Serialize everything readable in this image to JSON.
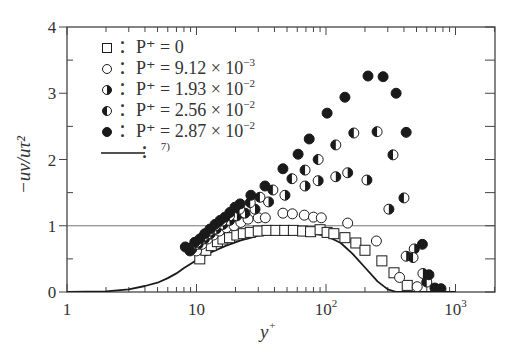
{
  "chart_data": {
    "type": "scatter",
    "title": "",
    "xlabel": "y+",
    "ylabel": "-uv/u_tau^2",
    "xscale": "log",
    "xlim": [
      1,
      2000
    ],
    "ylim": [
      0,
      4
    ],
    "xticks": [
      1,
      10,
      100,
      1000
    ],
    "xtick_labels": [
      "1",
      "10",
      "10^2",
      "10^3"
    ],
    "yticks": [
      0,
      1,
      2,
      3,
      4
    ],
    "ytick_labels": [
      "0",
      "1",
      "2",
      "3",
      "4"
    ],
    "reference_line": {
      "y": 1
    },
    "grid": false,
    "legend_position": "upper-left",
    "series": [
      {
        "name": "P+ = 0",
        "marker": "square-open",
        "points": [
          [
            10.6,
            0.5
          ],
          [
            11.8,
            0.63
          ],
          [
            13.0,
            0.7
          ],
          [
            14.5,
            0.76
          ],
          [
            16.0,
            0.8
          ],
          [
            18.0,
            0.82
          ],
          [
            20.5,
            0.86
          ],
          [
            23,
            0.88
          ],
          [
            26,
            0.9
          ],
          [
            30,
            0.92
          ],
          [
            35,
            0.93
          ],
          [
            41,
            0.93
          ],
          [
            48,
            0.93
          ],
          [
            56,
            0.93
          ],
          [
            66,
            0.92
          ],
          [
            76,
            0.91
          ],
          [
            90,
            0.94
          ],
          [
            102,
            0.9
          ],
          [
            115,
            0.88
          ],
          [
            140,
            0.82
          ],
          [
            170,
            0.74
          ],
          [
            200,
            0.63
          ],
          [
            270,
            0.47
          ],
          [
            335,
            0.29
          ],
          [
            424,
            0.1
          ]
        ]
      },
      {
        "name": "P+ = 9.12x10^-3",
        "marker": "circle-open",
        "points": [
          [
            10,
            0.62
          ],
          [
            11,
            0.72
          ],
          [
            12.2,
            0.8
          ],
          [
            13.5,
            0.86
          ],
          [
            15,
            0.92
          ],
          [
            17,
            0.97
          ],
          [
            19.5,
            1.0
          ],
          [
            22,
            1.05
          ],
          [
            25,
            1.1
          ],
          [
            30,
            1.12
          ],
          [
            34,
            1.12
          ],
          [
            46.5,
            1.19
          ],
          [
            55,
            1.18
          ],
          [
            68,
            1.16
          ],
          [
            80,
            1.13
          ],
          [
            92,
            1.12
          ],
          [
            147,
            1.04
          ],
          [
            245,
            0.77
          ],
          [
            370,
            0.22
          ],
          [
            506,
            0.08
          ]
        ]
      },
      {
        "name": "P+ = 1.93x10^-2",
        "marker": "circle-right-half-filled",
        "points": [
          [
            9.2,
            0.65
          ],
          [
            10.3,
            0.72
          ],
          [
            11.5,
            0.8
          ],
          [
            12.8,
            0.88
          ],
          [
            14.2,
            0.95
          ],
          [
            16,
            1.02
          ],
          [
            18,
            1.08
          ],
          [
            20.5,
            1.15
          ],
          [
            23.7,
            1.19
          ],
          [
            28.3,
            1.25
          ],
          [
            36,
            1.36
          ],
          [
            48.2,
            1.46
          ],
          [
            68.9,
            1.6
          ],
          [
            87,
            1.68
          ],
          [
            119,
            1.74
          ],
          [
            147,
            1.8
          ],
          [
            207,
            1.69
          ],
          [
            306,
            1.25
          ],
          [
            416,
            0.54
          ],
          [
            480,
            0.65
          ],
          [
            560,
            0.28
          ]
        ]
      },
      {
        "name": "P+ = 2.56x10^-2",
        "marker": "circle-left-half-filled",
        "points": [
          [
            9.0,
            0.66
          ],
          [
            10.1,
            0.75
          ],
          [
            11.3,
            0.84
          ],
          [
            12.6,
            0.92
          ],
          [
            14,
            1.0
          ],
          [
            15.8,
            1.07
          ],
          [
            18,
            1.15
          ],
          [
            21.5,
            1.25
          ],
          [
            26,
            1.35
          ],
          [
            30.9,
            1.43
          ],
          [
            38.9,
            1.54
          ],
          [
            54.6,
            1.71
          ],
          [
            68.9,
            1.84
          ],
          [
            87,
            2.0
          ],
          [
            119,
            2.22
          ],
          [
            164,
            2.4
          ],
          [
            248,
            2.42
          ],
          [
            329,
            2.07
          ],
          [
            400,
            1.42
          ],
          [
            470,
            0.52
          ],
          [
            600,
            0.15
          ]
        ]
      },
      {
        "name": "P+ = 2.87x10^-2",
        "marker": "circle-filled",
        "points": [
          [
            8.2,
            0.68
          ],
          [
            8.9,
            0.62
          ],
          [
            9.7,
            0.75
          ],
          [
            10.6,
            0.8
          ],
          [
            11.6,
            0.88
          ],
          [
            12.7,
            0.95
          ],
          [
            13.9,
            1.02
          ],
          [
            15.2,
            1.08
          ],
          [
            16.6,
            1.13
          ],
          [
            18.1,
            1.2
          ],
          [
            19.8,
            1.28
          ],
          [
            21.7,
            1.33
          ],
          [
            26.3,
            1.46
          ],
          [
            33.8,
            1.6
          ],
          [
            46.5,
            1.86
          ],
          [
            60.9,
            2.08
          ],
          [
            74.2,
            2.31
          ],
          [
            102,
            2.7
          ],
          [
            140,
            2.94
          ],
          [
            211,
            3.26
          ],
          [
            276,
            3.25
          ],
          [
            348,
            3.0
          ],
          [
            416,
            2.41
          ],
          [
            555,
            0.72
          ],
          [
            624,
            0.26
          ],
          [
            694,
            0.06
          ],
          [
            773,
            0.05
          ]
        ]
      },
      {
        "name": "Ref. 7)",
        "marker": "line",
        "points": [
          [
            1,
            0
          ],
          [
            2,
            0.01
          ],
          [
            3,
            0.04
          ],
          [
            4,
            0.09
          ],
          [
            5,
            0.14
          ],
          [
            6,
            0.21
          ],
          [
            7,
            0.28
          ],
          [
            8,
            0.36
          ],
          [
            10,
            0.48
          ],
          [
            13,
            0.6
          ],
          [
            17,
            0.7
          ],
          [
            22,
            0.78
          ],
          [
            30,
            0.85
          ],
          [
            40,
            0.89
          ],
          [
            55,
            0.9
          ],
          [
            75,
            0.89
          ],
          [
            100,
            0.85
          ],
          [
            130,
            0.74
          ],
          [
            160,
            0.58
          ],
          [
            200,
            0.37
          ],
          [
            250,
            0.16
          ],
          [
            300,
            0.04
          ],
          [
            350,
            0.0
          ],
          [
            1000,
            0.0
          ]
        ]
      }
    ]
  },
  "axes": {
    "y_title": "−uv/uτ²",
    "x_title": "y⁺",
    "y_ticks": [
      "0",
      "1",
      "2",
      "3",
      "4"
    ],
    "x_ticks": [
      {
        "base": "1",
        "exp": ""
      },
      {
        "base": "10",
        "exp": ""
      },
      {
        "base": "10",
        "exp": "2"
      },
      {
        "base": "10",
        "exp": "3"
      }
    ]
  },
  "legend": [
    {
      "marker": "square-open",
      "label": "：P⁺ = 0"
    },
    {
      "marker": "circle-open",
      "label": "：P⁺ = 9.12 × 10",
      "exp": "−3"
    },
    {
      "marker": "circle-right-half-filled",
      "label": "：P⁺ = 1.93 × 10",
      "exp": "−2"
    },
    {
      "marker": "circle-left-half-filled",
      "label": "：P⁺ = 2.56 × 10",
      "exp": "−2"
    },
    {
      "marker": "circle-filled",
      "label": "：P⁺ = 2.87 × 10",
      "exp": "−2"
    },
    {
      "marker": "line",
      "label": "：",
      "ref": "7)"
    }
  ],
  "colors": {
    "ink": "#1a1a1a",
    "frame": "#444444",
    "text": "#333333"
  }
}
